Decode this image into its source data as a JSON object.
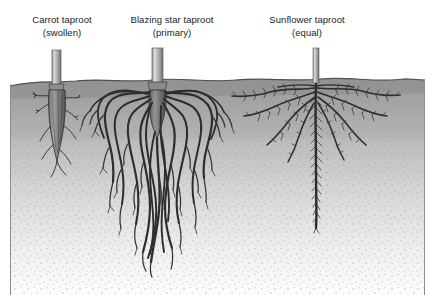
{
  "figure": {
    "background_color": "#ffffff",
    "width": 435,
    "height": 295
  },
  "labels": [
    {
      "name": "carrot",
      "line1": "Carrot taproot",
      "line2": "(swollen)"
    },
    {
      "name": "blazing",
      "line1": "Blazing star taproot",
      "line2": "(primary)"
    },
    {
      "name": "sunflower",
      "line1": "Sunflower taproot",
      "line2": "(equal)"
    }
  ],
  "colors": {
    "text": "#1d1d1d",
    "soil_top": "#9a9a9a",
    "soil_bottom": "#fdfdfd",
    "soil_surface_line": "#585858",
    "root_dark": "#2a2a2a",
    "root_mid": "#4a4a4a",
    "stem_light": "#d9d9d9",
    "stem_mid": "#9f9f9f",
    "stem_dark": "#6f6f6f",
    "frame": "#8d8d8d",
    "stipple": "#b4b4b4"
  },
  "scene": {
    "soil_surface_y": 78,
    "soil_region": {
      "x": 10,
      "y": 78,
      "width": 415,
      "height": 217
    },
    "plants": [
      {
        "name": "carrot-taproot",
        "type": "swollen",
        "stem_x": 57,
        "stem_top_y": 50,
        "root_depth_y": 160,
        "description": "Single thick conical swollen storage root tapering to a point with sparse thin lateral roots"
      },
      {
        "name": "blazing-star-taproot",
        "type": "primary",
        "stem_x": 158,
        "stem_top_y": 48,
        "root_depth_y": 272,
        "description": "Dense wide mass of thick fleshy roots radiating from a central crown and descending deeply"
      },
      {
        "name": "sunflower-taproot",
        "type": "equal",
        "stem_x": 316,
        "stem_top_y": 48,
        "root_depth_y": 228,
        "description": "Straight central taproot with dense fine lateral hairs plus wide shallow horizontal surface roots"
      }
    ]
  }
}
